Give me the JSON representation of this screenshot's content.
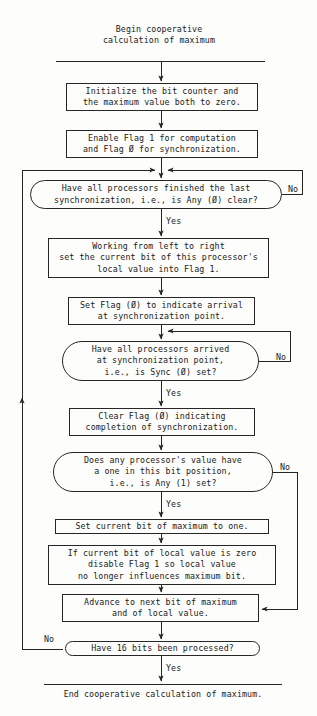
{
  "diagram": {
    "title_block": "Begin cooperative\ncalculation of maximum",
    "end_block": "End cooperative calculation of maximum.",
    "nodes": [
      {
        "id": "init",
        "kind": "process",
        "text": "Initialize the bit counter and\nthe maximum value both to zero."
      },
      {
        "id": "enable-flags",
        "kind": "process",
        "text": "Enable Flag 1 for computation\nand Flag Ø for synchronization."
      },
      {
        "id": "any-zero-clear",
        "kind": "decision",
        "text": "Have all processors finished the last\nsynchronization, i.e., is Any (Ø) clear?"
      },
      {
        "id": "set-local-bit",
        "kind": "process",
        "text": "Working from left to right\nset the current bit of this processor's\nlocal value into Flag 1."
      },
      {
        "id": "set-flag-zero",
        "kind": "process",
        "text": "Set Flag (Ø) to indicate arrival\nat synchronization point."
      },
      {
        "id": "sync-zero-set",
        "kind": "decision",
        "text": "Have all processors arrived\nat synchronization point,\ni.e., is Sync (Ø) set?"
      },
      {
        "id": "clear-flag-zero",
        "kind": "process",
        "text": "Clear Flag (Ø) indicating\ncompletion of synchronization."
      },
      {
        "id": "any-one-set",
        "kind": "decision",
        "text": "Does any processor's value have\na one in this bit position,\ni.e., is Any (1) set?"
      },
      {
        "id": "set-max-bit",
        "kind": "process",
        "text": "Set current bit of maximum to one."
      },
      {
        "id": "disable-flag-one",
        "kind": "process",
        "text": "If current bit of local value is zero\ndisable Flag 1 so local value\nno longer influences maximum bit."
      },
      {
        "id": "advance-bit",
        "kind": "process",
        "text": "Advance to next bit of maximum\nand of local value."
      },
      {
        "id": "sixteen-bits",
        "kind": "decision",
        "text": "Have 16 bits been processed?"
      }
    ],
    "edge_labels": {
      "no1": "No",
      "yes1": "Yes",
      "no2": "No",
      "yes2": "Yes",
      "no3": "No",
      "yes3": "Yes",
      "no4": "No",
      "yes4": "Yes"
    },
    "colors": {
      "ink": "#1a1a1a",
      "stroke": "#262626",
      "paper": "#fdfdfc"
    }
  }
}
